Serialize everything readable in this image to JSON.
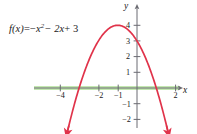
{
  "figure": {
    "equation_label": {
      "lhs": "f(x)",
      "equals": "=",
      "rhs_term1_sign": "−",
      "rhs_term1_base": "x",
      "rhs_term1_exp": "2",
      "rhs_term2": "− 2x",
      "rhs_term3": "+ 3",
      "full_text": "f(x) = −x² − 2x + 3"
    },
    "axis_labels": {
      "x": "x",
      "y": "y"
    },
    "colors": {
      "curve": "#e0334a",
      "axis": "#6b6b72",
      "axis_highlight": "#c3e8b0",
      "text": "#1a1a1a",
      "background": "#ffffff"
    }
  },
  "chart_data": {
    "type": "line",
    "title": "",
    "xlabel": "x",
    "ylabel": "y",
    "grid": false,
    "legend": false,
    "annotations": [
      "f(x) = −x² − 2x + 3"
    ],
    "function": "f(x) = -x^2 - 2x + 3",
    "xlim": [
      -4.9,
      2.6
    ],
    "ylim": [
      -2.6,
      4.7
    ],
    "xticks": [
      -4,
      -2,
      -1,
      2
    ],
    "xtick_labels": [
      "−4",
      "−2",
      "−1",
      "2"
    ],
    "yticks": [
      -2,
      -1,
      1,
      2,
      3,
      4
    ],
    "ytick_labels": [
      "−2",
      "−1",
      "1",
      "2",
      "3",
      "4"
    ],
    "vertex": [
      -1,
      4
    ],
    "x_intercepts": [
      -3,
      1
    ],
    "y_intercept": 3,
    "x": [
      -3.6,
      -3.4,
      -3.2,
      -3,
      -2.8,
      -2.6,
      -2.4,
      -2.2,
      -2,
      -1.8,
      -1.6,
      -1.4,
      -1.2,
      -1,
      -0.8,
      -0.6,
      -0.4,
      -0.2,
      0,
      0.2,
      0.4,
      0.6,
      0.8,
      1,
      1.2,
      1.4,
      1.6
    ],
    "y": [
      -3.24,
      -2.36,
      -1.56,
      -0.84,
      -0.2,
      0.36,
      0.84,
      1.24,
      1.56,
      1.8,
      1.96,
      2.04,
      2.04,
      4,
      3.96,
      3.84,
      3.64,
      3.36,
      3,
      2.56,
      2.04,
      1.44,
      0.76,
      0,
      -0.84,
      -1.76,
      -2.76
    ],
    "series": [
      {
        "name": "f(x) = −x² − 2x + 3",
        "color": "#e0334a",
        "values": [
          -3.24,
          -2.36,
          -1.56,
          -0.84,
          -0.2,
          0.36,
          0.84,
          1.24,
          1.56,
          1.8,
          1.96,
          2.04,
          2.04,
          4,
          3.96,
          3.84,
          3.64,
          3.36,
          3,
          2.56,
          2.04,
          1.44,
          0.76,
          0,
          -0.84,
          -1.76,
          -2.76
        ]
      }
    ]
  }
}
